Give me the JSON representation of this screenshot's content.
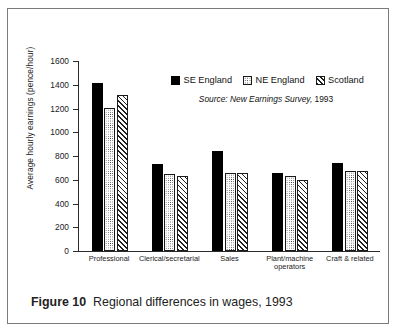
{
  "figure": {
    "number_label": "Figure 10",
    "caption": "Regional differences in wages, 1993"
  },
  "source_note": {
    "italic_part": "Source: New Earnings Survey,",
    "year": " 1993"
  },
  "legend": {
    "items": [
      {
        "label": "SE England",
        "pattern": "solid-black",
        "color": "#000000"
      },
      {
        "label": "NE England",
        "pattern": "dotted",
        "color": "#2b2b2b"
      },
      {
        "label": "Scotland",
        "pattern": "diagonal-hatch",
        "color": "#1f1f1f"
      }
    ]
  },
  "chart_data": {
    "type": "bar",
    "title": "",
    "xlabel": "",
    "ylabel": "Average hourly earnings (pence/hour)",
    "ylim": [
      0,
      1600
    ],
    "yticks": [
      "0",
      "200",
      "400",
      "600",
      "800",
      "1000",
      "1200",
      "1400",
      "1600"
    ],
    "ytick_values": [
      0,
      200,
      400,
      600,
      800,
      1000,
      1200,
      1400,
      1600
    ],
    "grid": false,
    "legend_position": "upper-right-inside",
    "categories": [
      "Professional",
      "Clerical/secretarial",
      "Sales",
      "Plant/machine operators",
      "Craft & related"
    ],
    "category_lines": [
      [
        "Professional"
      ],
      [
        "Clerical/secretarial"
      ],
      [
        "Sales"
      ],
      [
        "Plant/machine",
        "operators"
      ],
      [
        "Craft & related"
      ]
    ],
    "series": [
      {
        "name": "SE England",
        "values": [
          1415,
          735,
          845,
          660,
          745
        ]
      },
      {
        "name": "NE England",
        "values": [
          1205,
          648,
          660,
          632,
          675
        ]
      },
      {
        "name": "Scotland",
        "values": [
          1310,
          632,
          655,
          600,
          675
        ]
      }
    ]
  }
}
